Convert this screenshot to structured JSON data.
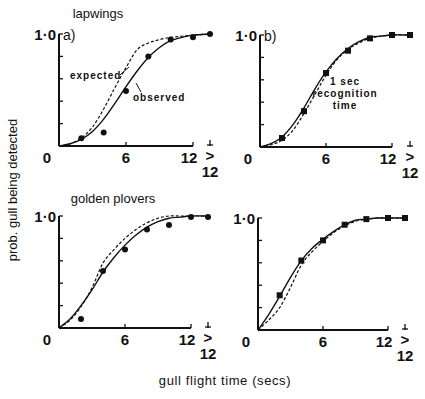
{
  "figure": {
    "ylabel": "prob. gull being detected",
    "xlabel": "gull flight time (secs)",
    "row_titles": [
      "lapwings",
      "golden plovers"
    ],
    "column_labels": [
      "a)",
      "b)"
    ],
    "ytick_top": "1·0",
    "xticks": [
      "0",
      "6",
      "12"
    ],
    "xtick_extra_top": ">",
    "xtick_extra_bottom": "12",
    "annotations": {
      "expected": "expected",
      "observed": "observed",
      "recognition_line1": "1 sec",
      "recognition_line2": "recognition",
      "recognition_line3": "time"
    }
  },
  "chart_data": [
    {
      "type": "line",
      "panel": "a",
      "title": "lapwings",
      "xlabel": "gull flight time (secs)",
      "ylabel": "prob. gull being detected",
      "x": [
        "0",
        "2",
        "4",
        "6",
        "8",
        "10",
        "12",
        ">12"
      ],
      "xlim": [
        0,
        12
      ],
      "ylim": [
        0,
        1.0
      ],
      "marker": "circle",
      "series": [
        {
          "name": "observed (data)",
          "style": "points",
          "x": [
            2,
            4,
            6,
            8,
            10,
            12,
            13.5
          ],
          "values": [
            0.07,
            0.12,
            0.49,
            0.8,
            0.95,
            0.97,
            1.0
          ]
        },
        {
          "name": "observed",
          "style": "solid",
          "x": [
            0,
            1,
            2,
            3,
            4,
            5,
            6,
            7,
            8,
            9,
            10,
            11,
            12,
            13.5
          ],
          "values": [
            0,
            0.02,
            0.06,
            0.13,
            0.24,
            0.38,
            0.53,
            0.67,
            0.79,
            0.88,
            0.94,
            0.97,
            0.99,
            1.0
          ]
        },
        {
          "name": "expected",
          "style": "dashed",
          "x": [
            0,
            1,
            2,
            3,
            4,
            5,
            6,
            7,
            8,
            9,
            10,
            11,
            12,
            13.5
          ],
          "values": [
            0,
            0.02,
            0.07,
            0.17,
            0.33,
            0.52,
            0.7,
            0.86,
            0.92,
            0.95,
            0.97,
            0.98,
            0.99,
            1.0
          ]
        }
      ],
      "annotations": [
        "expected",
        "observed"
      ]
    },
    {
      "type": "line",
      "panel": "b",
      "title": "lapwings, 1 sec recognition time",
      "x": [
        "0",
        "2",
        "4",
        "6",
        "8",
        "10",
        "12",
        ">12"
      ],
      "xlim": [
        0,
        12
      ],
      "ylim": [
        0,
        1.0
      ],
      "marker": "square",
      "series": [
        {
          "name": "observed (data)",
          "style": "points",
          "x": [
            2,
            4,
            6,
            8,
            10,
            12,
            13.5
          ],
          "values": [
            0.08,
            0.32,
            0.66,
            0.86,
            0.97,
            1.0,
            1.0
          ]
        },
        {
          "name": "observed",
          "style": "solid",
          "x": [
            0,
            1,
            2,
            3,
            4,
            5,
            6,
            7,
            8,
            9,
            10,
            11,
            12,
            13.5
          ],
          "values": [
            0,
            0.03,
            0.09,
            0.2,
            0.35,
            0.52,
            0.67,
            0.79,
            0.88,
            0.94,
            0.98,
            0.99,
            1.0,
            1.0
          ]
        },
        {
          "name": "expected",
          "style": "dashed",
          "x": [
            0,
            1,
            2,
            3,
            4,
            5,
            6,
            7,
            8,
            9,
            10,
            11,
            12,
            13.5
          ],
          "values": [
            0,
            0.02,
            0.06,
            0.15,
            0.3,
            0.47,
            0.64,
            0.78,
            0.87,
            0.93,
            0.97,
            0.99,
            1.0,
            1.0
          ]
        }
      ],
      "annotations": [
        "1 sec recognition time"
      ]
    },
    {
      "type": "line",
      "panel": "c",
      "title": "golden plovers",
      "x": [
        "0",
        "2",
        "4",
        "6",
        "8",
        "10",
        "12",
        ">12"
      ],
      "xlim": [
        0,
        12
      ],
      "ylim": [
        0,
        1.0
      ],
      "marker": "circle",
      "series": [
        {
          "name": "observed (data)",
          "style": "points",
          "x": [
            2,
            4,
            6,
            8,
            10,
            12,
            13.5
          ],
          "values": [
            0.08,
            0.51,
            0.7,
            0.88,
            0.92,
            0.99,
            0.99
          ]
        },
        {
          "name": "observed",
          "style": "solid",
          "x": [
            0,
            1,
            2,
            3,
            4,
            5,
            6,
            7,
            8,
            9,
            10,
            11,
            12,
            13.5
          ],
          "values": [
            0,
            0.08,
            0.2,
            0.34,
            0.5,
            0.63,
            0.74,
            0.83,
            0.9,
            0.95,
            0.98,
            0.99,
            1.0,
            1.0
          ]
        },
        {
          "name": "expected",
          "style": "dashed",
          "x": [
            0,
            1,
            2,
            3,
            4,
            5,
            6,
            7,
            8,
            9,
            10,
            11,
            12,
            13.5
          ],
          "values": [
            0,
            0.07,
            0.19,
            0.36,
            0.58,
            0.7,
            0.8,
            0.88,
            0.94,
            0.98,
            1.0,
            1.0,
            1.0,
            1.0
          ]
        }
      ]
    },
    {
      "type": "line",
      "panel": "d",
      "title": "golden plovers, 1 sec recognition time",
      "x": [
        "0",
        "2",
        "4",
        "6",
        "8",
        "10",
        "12",
        ">12"
      ],
      "xlim": [
        0,
        12
      ],
      "ylim": [
        0,
        1.0
      ],
      "marker": "square",
      "series": [
        {
          "name": "observed (data)",
          "style": "points",
          "x": [
            2,
            4,
            6,
            8,
            10,
            12,
            13.5
          ],
          "values": [
            0.31,
            0.62,
            0.8,
            0.94,
            0.99,
            1.0,
            1.0
          ]
        },
        {
          "name": "observed",
          "style": "solid",
          "x": [
            0,
            1,
            2,
            3,
            4,
            5,
            6,
            7,
            8,
            9,
            10,
            11,
            12,
            13.5
          ],
          "values": [
            0,
            0.14,
            0.3,
            0.47,
            0.62,
            0.73,
            0.81,
            0.88,
            0.94,
            0.98,
            0.99,
            1.0,
            1.0,
            1.0
          ]
        },
        {
          "name": "expected",
          "style": "dashed",
          "x": [
            0,
            1,
            2,
            3,
            4,
            5,
            6,
            7,
            8,
            9,
            10,
            11,
            12,
            13.5
          ],
          "values": [
            0,
            0.09,
            0.2,
            0.38,
            0.58,
            0.7,
            0.79,
            0.87,
            0.93,
            0.97,
            0.99,
            1.0,
            1.0,
            1.0
          ]
        }
      ]
    }
  ]
}
